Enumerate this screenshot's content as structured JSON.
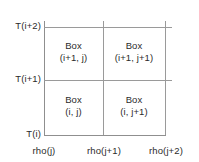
{
  "diagram": {
    "background_color": "#ffffff",
    "line_color": "#9a9a9a",
    "text_color": "#2b2b2b",
    "y_axis": {
      "name": "T",
      "ticks": [
        {
          "label": "T(i)"
        },
        {
          "label": "T(i+1)"
        },
        {
          "label": "T(i+2)"
        }
      ]
    },
    "x_axis": {
      "name": "rho",
      "ticks": [
        {
          "label": "rho(j)"
        },
        {
          "label": "rho(j+1)"
        },
        {
          "label": "rho(j+2)"
        }
      ]
    },
    "cells": [
      {
        "name": "box-i1-j",
        "line1": "Box",
        "line2": "(i+1, j)"
      },
      {
        "name": "box-i1-j1",
        "line1": "Box",
        "line2": "(i+1, j+1)"
      },
      {
        "name": "box-i-j",
        "line1": "Box",
        "line2": "(i, j)"
      },
      {
        "name": "box-i-j1",
        "line1": "Box",
        "line2": "(i, j+1)"
      }
    ]
  }
}
